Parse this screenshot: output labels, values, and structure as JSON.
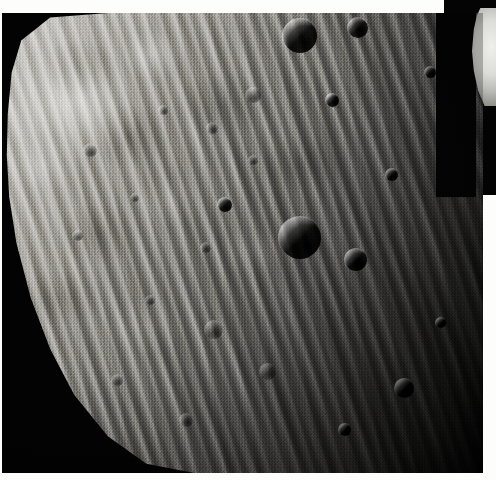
{
  "image": {
    "kind": "spacecraft-photograph",
    "subject": "grooved and cratered surface of a small irregular moon",
    "palette": "grayscale",
    "width_px": 496,
    "height_px": 480,
    "caption": "",
    "colors": {
      "space_black": "#030303",
      "frame_white": "#fdfdfb",
      "terrain_light": "#cfcdc9",
      "terrain_mid": "#7d7b76",
      "terrain_dark": "#1d1d1c",
      "limb_highlight": "#efefec"
    }
  },
  "frame": {
    "top_band": "",
    "bottom_band": "",
    "left_band": "",
    "right_band": ""
  },
  "scene": {
    "background_label": "",
    "body_label": "",
    "limb_fragment_label": "",
    "shadow_label": "",
    "terminator_label": ""
  },
  "surface": {
    "groove_families": 3,
    "groove_orientation": "upper-right to lower-left diagonal striations",
    "illumination": "sunlit from the upper left, terminator falling to the lower right",
    "craters": [
      {
        "id": "crater-1",
        "x": 300,
        "y": 36,
        "d": 34,
        "style": "sharp"
      },
      {
        "id": "crater-2",
        "x": 358,
        "y": 28,
        "d": 20,
        "style": "sharp"
      },
      {
        "id": "crater-3",
        "x": 253,
        "y": 95,
        "d": 15,
        "style": "soft"
      },
      {
        "id": "crater-4",
        "x": 332,
        "y": 100,
        "d": 13,
        "style": "sharp"
      },
      {
        "id": "crater-5",
        "x": 212,
        "y": 128,
        "d": 11,
        "style": "soft"
      },
      {
        "id": "crater-6",
        "x": 163,
        "y": 110,
        "d": 9,
        "style": "soft"
      },
      {
        "id": "crater-7",
        "x": 90,
        "y": 150,
        "d": 13,
        "style": "soft"
      },
      {
        "id": "crater-8",
        "x": 78,
        "y": 236,
        "d": 10,
        "style": "soft"
      },
      {
        "id": "crater-9",
        "x": 135,
        "y": 198,
        "d": 8,
        "style": "soft"
      },
      {
        "id": "crater-10",
        "x": 225,
        "y": 205,
        "d": 14,
        "style": "sharp"
      },
      {
        "id": "crater-11",
        "x": 300,
        "y": 238,
        "d": 42,
        "style": "sharp"
      },
      {
        "id": "crater-12",
        "x": 356,
        "y": 260,
        "d": 22,
        "style": "sharp"
      },
      {
        "id": "crater-13",
        "x": 206,
        "y": 248,
        "d": 10,
        "style": "soft"
      },
      {
        "id": "crater-14",
        "x": 150,
        "y": 300,
        "d": 9,
        "style": "soft"
      },
      {
        "id": "crater-15",
        "x": 214,
        "y": 330,
        "d": 18,
        "style": "soft"
      },
      {
        "id": "crater-16",
        "x": 268,
        "y": 372,
        "d": 16,
        "style": "soft"
      },
      {
        "id": "crater-17",
        "x": 404,
        "y": 388,
        "d": 19,
        "style": "sharp"
      },
      {
        "id": "crater-18",
        "x": 345,
        "y": 430,
        "d": 12,
        "style": "sharp"
      },
      {
        "id": "crater-19",
        "x": 441,
        "y": 323,
        "d": 10,
        "style": "sharp"
      },
      {
        "id": "crater-20",
        "x": 392,
        "y": 175,
        "d": 12,
        "style": "sharp"
      },
      {
        "id": "crater-21",
        "x": 117,
        "y": 380,
        "d": 11,
        "style": "soft"
      },
      {
        "id": "crater-22",
        "x": 186,
        "y": 420,
        "d": 13,
        "style": "soft"
      },
      {
        "id": "crater-23",
        "x": 253,
        "y": 160,
        "d": 9,
        "style": "soft"
      },
      {
        "id": "crater-24",
        "x": 430,
        "y": 72,
        "d": 11,
        "style": "sharp"
      }
    ]
  }
}
